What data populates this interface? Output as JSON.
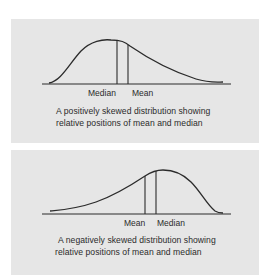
{
  "colors": {
    "background": "#ffffff",
    "panel": "#e6e6e6",
    "ink": "#2b2b2b"
  },
  "figures": [
    {
      "id": "positive-skew",
      "labels": {
        "left": "Median",
        "right": "Mean"
      },
      "caption": {
        "line1": "A positively skewed distribution showing",
        "line2": "relative positions of mean and median"
      }
    },
    {
      "id": "negative-skew",
      "labels": {
        "left": "Mean",
        "right": "Median"
      },
      "caption": {
        "line1": "A negatively skewed distribution showing",
        "line2": "relative positions of mean and median"
      }
    }
  ]
}
